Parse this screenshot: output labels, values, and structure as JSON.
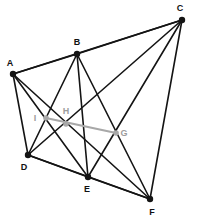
{
  "figure": {
    "width": 198,
    "height": 224,
    "background": "#ffffff",
    "edge_color": "#141414",
    "vertex_color": "#141414",
    "gray_color": "#a8a8a8",
    "gray_label_color": "#9c9c9c"
  },
  "vertices": [
    {
      "id": "A",
      "label": "A",
      "x": 13,
      "y": 74,
      "r": 3.2,
      "color": "#141414",
      "label_x": 10,
      "label_y": 63,
      "kind": "primary"
    },
    {
      "id": "B",
      "label": "B",
      "x": 77,
      "y": 54,
      "r": 3.2,
      "color": "#141414",
      "label_x": 77,
      "label_y": 42,
      "kind": "primary"
    },
    {
      "id": "C",
      "label": "C",
      "x": 182,
      "y": 20,
      "r": 3.2,
      "color": "#141414",
      "label_x": 180,
      "label_y": 8,
      "kind": "primary"
    },
    {
      "id": "D",
      "label": "D",
      "x": 28,
      "y": 155,
      "r": 3.2,
      "color": "#141414",
      "label_x": 24,
      "label_y": 167,
      "kind": "primary"
    },
    {
      "id": "E",
      "label": "E",
      "x": 88,
      "y": 177,
      "r": 3.2,
      "color": "#141414",
      "label_x": 87,
      "label_y": 189,
      "kind": "primary"
    },
    {
      "id": "F",
      "label": "F",
      "x": 150,
      "y": 199,
      "r": 3.2,
      "color": "#141414",
      "label_x": 152,
      "label_y": 212,
      "kind": "primary"
    },
    {
      "id": "G",
      "label": "G",
      "x": 116,
      "y": 133,
      "r": 2.8,
      "color": "#a8a8a8",
      "label_x": 124,
      "label_y": 133,
      "kind": "gray"
    },
    {
      "id": "H",
      "label": "H",
      "x": 66,
      "y": 124,
      "r": 2.8,
      "color": "#a8a8a8",
      "label_x": 66,
      "label_y": 111,
      "kind": "gray"
    },
    {
      "id": "I",
      "label": "I",
      "x": 46,
      "y": 118,
      "r": 2.8,
      "color": "#a8a8a8",
      "label_x": 35,
      "label_y": 118,
      "kind": "gray"
    }
  ],
  "edges": [
    {
      "from": "A",
      "to": "B",
      "color": "#141414",
      "width": 1.6
    },
    {
      "from": "A",
      "to": "C",
      "color": "#141414",
      "width": 1.6
    },
    {
      "from": "A",
      "to": "D",
      "color": "#141414",
      "width": 1.6
    },
    {
      "from": "A",
      "to": "E",
      "color": "#141414",
      "width": 1.6
    },
    {
      "from": "A",
      "to": "F",
      "color": "#141414",
      "width": 1.6
    },
    {
      "from": "B",
      "to": "C",
      "color": "#141414",
      "width": 1.6
    },
    {
      "from": "B",
      "to": "D",
      "color": "#141414",
      "width": 1.6
    },
    {
      "from": "B",
      "to": "E",
      "color": "#141414",
      "width": 1.6
    },
    {
      "from": "B",
      "to": "F",
      "color": "#141414",
      "width": 1.6
    },
    {
      "from": "C",
      "to": "D",
      "color": "#141414",
      "width": 1.6
    },
    {
      "from": "C",
      "to": "E",
      "color": "#141414",
      "width": 1.6
    },
    {
      "from": "C",
      "to": "F",
      "color": "#141414",
      "width": 1.6
    },
    {
      "from": "D",
      "to": "E",
      "color": "#141414",
      "width": 1.6
    },
    {
      "from": "D",
      "to": "F",
      "color": "#141414",
      "width": 1.6
    },
    {
      "from": "E",
      "to": "F",
      "color": "#141414",
      "width": 1.6
    },
    {
      "from": "I",
      "to": "G",
      "color": "#a8a8a8",
      "width": 2.2
    }
  ]
}
